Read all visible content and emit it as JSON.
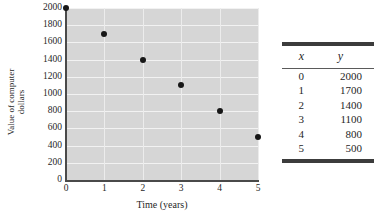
{
  "chart_data": {
    "type": "scatter",
    "title": "",
    "xlabel": "Time (years)",
    "ylabel_line1": "Value of computer",
    "ylabel_line2": "dollars",
    "x": [
      0,
      1,
      2,
      3,
      4,
      5
    ],
    "values": [
      2000,
      1700,
      1400,
      1100,
      800,
      500
    ],
    "xlim": [
      0,
      5
    ],
    "ylim": [
      0,
      2000
    ],
    "xticks": [
      "0",
      "1",
      "2",
      "3",
      "4",
      "5"
    ],
    "yticks": [
      "0",
      "200",
      "400",
      "600",
      "800",
      "1000",
      "1200",
      "1400",
      "1600",
      "1800",
      "2000"
    ],
    "grid": true,
    "legend": "none",
    "marker_color": "#171717",
    "plot_background": "#d6d6d6",
    "gridline_color": "#f2f2f2"
  },
  "table": {
    "headers": [
      "x",
      "y"
    ],
    "rows": [
      {
        "x": "0",
        "y": "2000"
      },
      {
        "x": "1",
        "y": "1700"
      },
      {
        "x": "2",
        "y": "1400"
      },
      {
        "x": "3",
        "y": "1100"
      },
      {
        "x": "4",
        "y": "800"
      },
      {
        "x": "5",
        "y": "500"
      }
    ]
  }
}
